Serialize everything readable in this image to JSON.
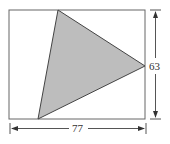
{
  "diagram": {
    "shape": "triangle inscribed in rectangle",
    "rectangle": {
      "width_label": "77",
      "height_label": "63"
    },
    "colors": {
      "stroke": "#555555",
      "fill": "#bdbdbd",
      "background": "#ffffff"
    }
  }
}
